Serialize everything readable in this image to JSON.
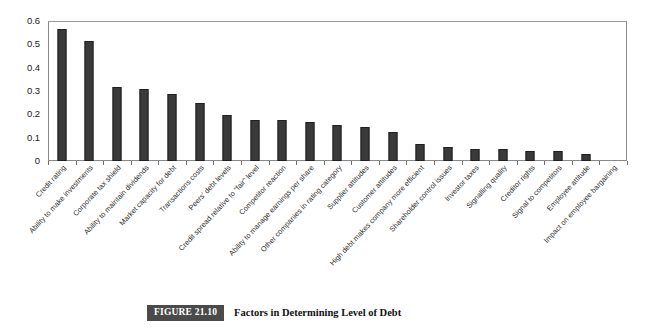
{
  "figure": {
    "badge": "FIGURE 21.10",
    "caption": "Factors in Determining Level of Debt"
  },
  "chart_data": {
    "type": "bar",
    "title": "Factors in Determining Level of Debt",
    "xlabel": "",
    "ylabel": "",
    "ylim": [
      0,
      0.6
    ],
    "grid": false,
    "legend": "none",
    "bar_color": "#3a3a3a",
    "yticks": [
      "0",
      "0.1",
      "0.2",
      "0.3",
      "0.4",
      "0.5",
      "0.6"
    ],
    "ytick_values": [
      0,
      0.1,
      0.2,
      0.3,
      0.4,
      0.5,
      0.6
    ],
    "categories": [
      "Credit rating",
      "Ability to make investments",
      "Corporate tax shield",
      "Ability to maintain dividends",
      "Market capacity for debt",
      "Transactions costs",
      "Peers' debt levels",
      "Credit spread relative to \"fair\" level",
      "Competitor reaction",
      "Ability to manage earnings per share",
      "Other companies in rating category",
      "Supplier attitudes",
      "Customer attitudes",
      "High debt makes company more efficient",
      "Shareholder control issues",
      "Investor taxes",
      "Signalling quality",
      "Creditor rights",
      "Signal to competitors",
      "Employee attitude",
      "Impact on employee bargaining"
    ],
    "values": [
      0.565,
      0.515,
      0.318,
      0.307,
      0.287,
      0.247,
      0.197,
      0.175,
      0.175,
      0.166,
      0.155,
      0.145,
      0.124,
      0.072,
      0.062,
      0.052,
      0.051,
      0.041,
      0.041,
      0.029,
      0.0
    ]
  }
}
